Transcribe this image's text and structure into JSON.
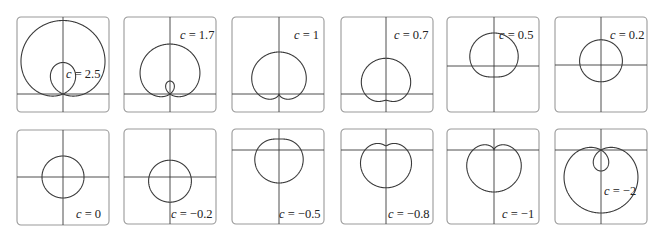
{
  "chart_data": {
    "type": "line",
    "title": "",
    "equation": "r = 1 + c sin θ",
    "grid": false,
    "legend": "none",
    "panels": [
      {
        "c": 2.5,
        "label": "c = 2.5",
        "box": [
          17,
          17
        ],
        "origin": [
          46,
          77
        ],
        "scale": 21.0,
        "label_pos": [
          49,
          49
        ]
      },
      {
        "c": 1.7,
        "label": "c = 1.7",
        "box": [
          124,
          17
        ],
        "origin": [
          46,
          77
        ],
        "scale": 18.5,
        "label_pos": [
          56,
          10
        ]
      },
      {
        "c": 1,
        "label": "c = 1",
        "box": [
          232,
          17
        ],
        "origin": [
          47,
          77
        ],
        "scale": 21.0,
        "label_pos": [
          62,
          10
        ]
      },
      {
        "c": 0.7,
        "label": "c = 0.7",
        "box": [
          341,
          17
        ],
        "origin": [
          45,
          77
        ],
        "scale": 21.0,
        "label_pos": [
          53,
          10
        ]
      },
      {
        "c": 0.5,
        "label": "c = 0.5",
        "box": [
          447,
          17
        ],
        "origin": [
          47,
          49
        ],
        "scale": 22.0,
        "label_pos": [
          52,
          10
        ]
      },
      {
        "c": 0.2,
        "label": "c = 0.2",
        "box": [
          555,
          17
        ],
        "origin": [
          46,
          48
        ],
        "scale": 21.0,
        "label_pos": [
          55,
          10
        ]
      },
      {
        "c": 0,
        "label": "c = 0",
        "box": [
          17,
          130
        ],
        "origin": [
          46,
          47
        ],
        "scale": 21.0,
        "label_pos": [
          59,
          76
        ]
      },
      {
        "c": -0.2,
        "label": "c = −0.2",
        "box": [
          124,
          129
        ],
        "origin": [
          46,
          48
        ],
        "scale": 21.0,
        "label_pos": [
          47,
          77
        ]
      },
      {
        "c": -0.5,
        "label": "c = −0.5",
        "box": [
          232,
          129
        ],
        "origin": [
          47,
          21
        ],
        "scale": 22.0,
        "label_pos": [
          47,
          77
        ]
      },
      {
        "c": -0.8,
        "label": "c = −0.8",
        "box": [
          341,
          129
        ],
        "origin": [
          45,
          21
        ],
        "scale": 21.0,
        "label_pos": [
          47,
          77
        ]
      },
      {
        "c": -1,
        "label": "c = −1",
        "box": [
          447,
          129
        ],
        "origin": [
          47,
          21
        ],
        "scale": 21.0,
        "label_pos": [
          55,
          77
        ]
      },
      {
        "c": -2,
        "label": "c = −2",
        "box": [
          555,
          129
        ],
        "origin": [
          46,
          21
        ],
        "scale": 21.0,
        "label_pos": [
          49,
          54
        ]
      }
    ],
    "box_size": [
      92,
      95
    ],
    "xlabel": "",
    "ylabel": ""
  }
}
